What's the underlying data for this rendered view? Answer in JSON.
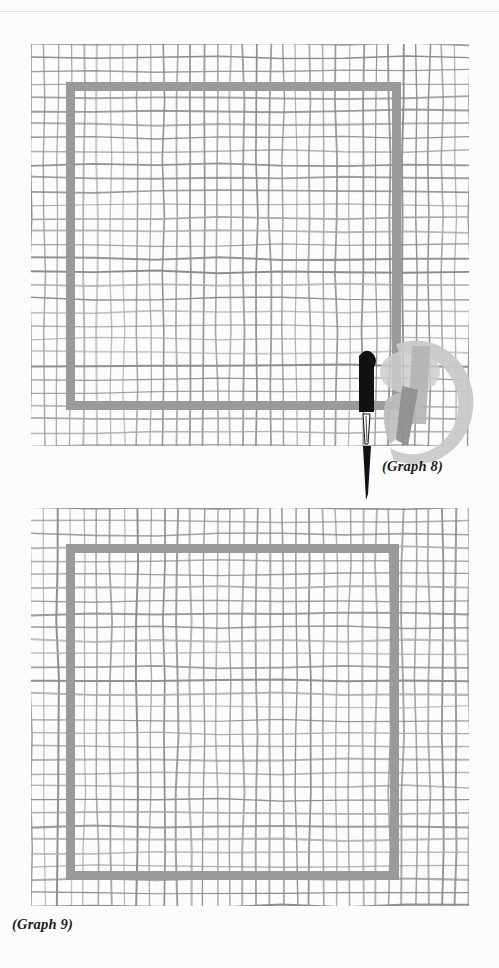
{
  "page": {
    "background_color": "#fcfcfc",
    "rule_color": "#e2e2e2",
    "width": 499,
    "height": 968
  },
  "palette": {
    "grid_line": "#8d8d8d",
    "grid_line_light": "#a8a8a8",
    "square_outline": "#9a9a9a",
    "needle_dark": "#111111",
    "watermark_light": "#c9c9c9",
    "watermark_mid": "#b0b0b0",
    "watermark_dark": "#7e7e7e",
    "caption_text": "#1b1b1b"
  },
  "figures": [
    {
      "id": "graph-8",
      "caption": "(Graph 8)",
      "caption_position": "bottom-right",
      "grid": {
        "cols": 33,
        "rows": 30,
        "cell_size": 13.3,
        "hand_drawn": true
      },
      "square": {
        "label": "gray square outline",
        "stroke_width": 9,
        "stroke_color": "#9a9a9a"
      },
      "needle": {
        "label": "sewing needle",
        "orientation": "vertical",
        "eye_position": "top",
        "point_direction": "down"
      },
      "watermark": {
        "label": "circular stamp watermark",
        "shape": "ring"
      }
    },
    {
      "id": "graph-9",
      "caption": "(Graph 9)",
      "caption_position": "bottom-left",
      "grid": {
        "cols": 33,
        "rows": 30,
        "cell_size": 13.3,
        "hand_drawn": true
      },
      "square": {
        "label": "gray square outline",
        "stroke_width": 9,
        "stroke_color": "#9a9a9a"
      },
      "needle": {
        "label": "sewing needle",
        "orientation": "diagonal",
        "eye_position": "top-right",
        "point_direction": "down-left"
      },
      "watermark": {
        "label": "circular stamp watermark",
        "shape": "ring"
      }
    }
  ],
  "chart_data": {
    "type": "table",
    "categories": [
      "Graph 8",
      "Graph 9"
    ],
    "series": [
      {
        "name": "grid columns",
        "values": [
          33,
          33
        ]
      },
      {
        "name": "grid rows",
        "values": [
          30,
          30
        ]
      },
      {
        "name": "square side (cells)",
        "values": [
          25,
          25
        ]
      }
    ],
    "xlabel": "",
    "ylabel": "",
    "grid": true,
    "legend": "none"
  }
}
